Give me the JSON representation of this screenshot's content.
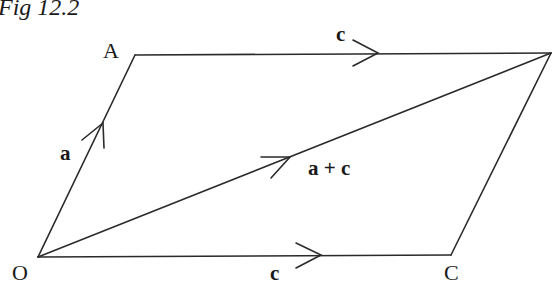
{
  "figure": {
    "title": "Fig 12.2",
    "points": {
      "O": {
        "label": "O",
        "x": 38,
        "y": 257
      },
      "A": {
        "label": "A",
        "x": 135,
        "y": 55
      },
      "B": {
        "label": "",
        "x": 551,
        "y": 53
      },
      "C": {
        "label": "C",
        "x": 451,
        "y": 255
      }
    },
    "vectors": [
      {
        "name": "a",
        "label": "a",
        "from": "O",
        "to": "A"
      },
      {
        "name": "c-top",
        "label": "c",
        "from": "A",
        "to": "B"
      },
      {
        "name": "c-bottom",
        "label": "c",
        "from": "O",
        "to": "C"
      },
      {
        "name": "a-plus-c",
        "label": "a + c",
        "from": "O",
        "to": "B"
      }
    ],
    "stroke_color": "#2a2a2a",
    "text_color": "#1a1a1a"
  }
}
